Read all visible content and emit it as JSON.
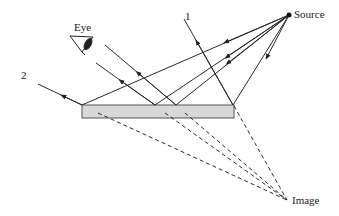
{
  "diagram": {
    "labels": {
      "source": "Source",
      "eye": "Eye",
      "image": "Image",
      "ray1": "1",
      "ray2": "2"
    },
    "colors": {
      "line": "#2a2a2a",
      "mirror_fill": "#d8d8d8",
      "mirror_stroke": "#555555"
    },
    "points": {
      "source": [
        289,
        15
      ],
      "image": [
        287,
        200
      ],
      "mirror": {
        "x": 82,
        "y": 105,
        "width": 152,
        "height": 13
      },
      "reflection_points": [
        [
          82,
          105
        ],
        [
          155,
          105
        ],
        [
          176,
          105
        ],
        [
          233,
          105
        ]
      ]
    }
  }
}
